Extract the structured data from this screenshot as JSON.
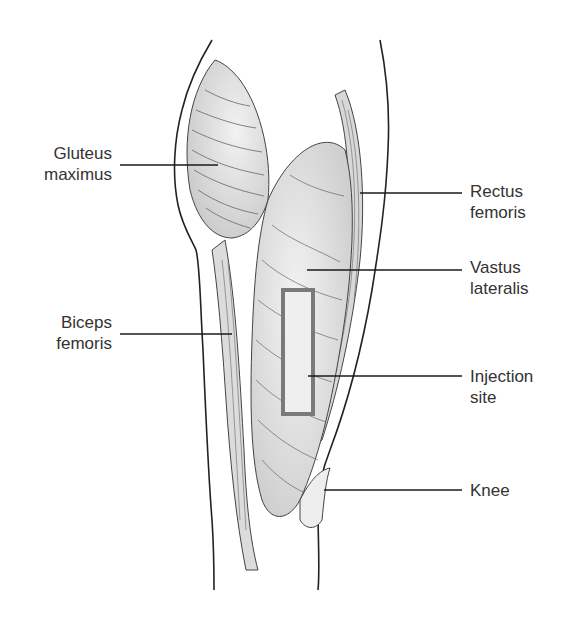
{
  "figure": {
    "injection_site_color": "#7a7a7a"
  },
  "labels": {
    "gluteus_maximus": "Gluteus\nmaximus",
    "biceps_femoris": "Biceps\nfemoris",
    "rectus_femoris": "Rectus\nfemoris",
    "vastus_lateralis": "Vastus\nlateralis",
    "injection_site": "Injection\nsite",
    "knee": "Knee"
  }
}
